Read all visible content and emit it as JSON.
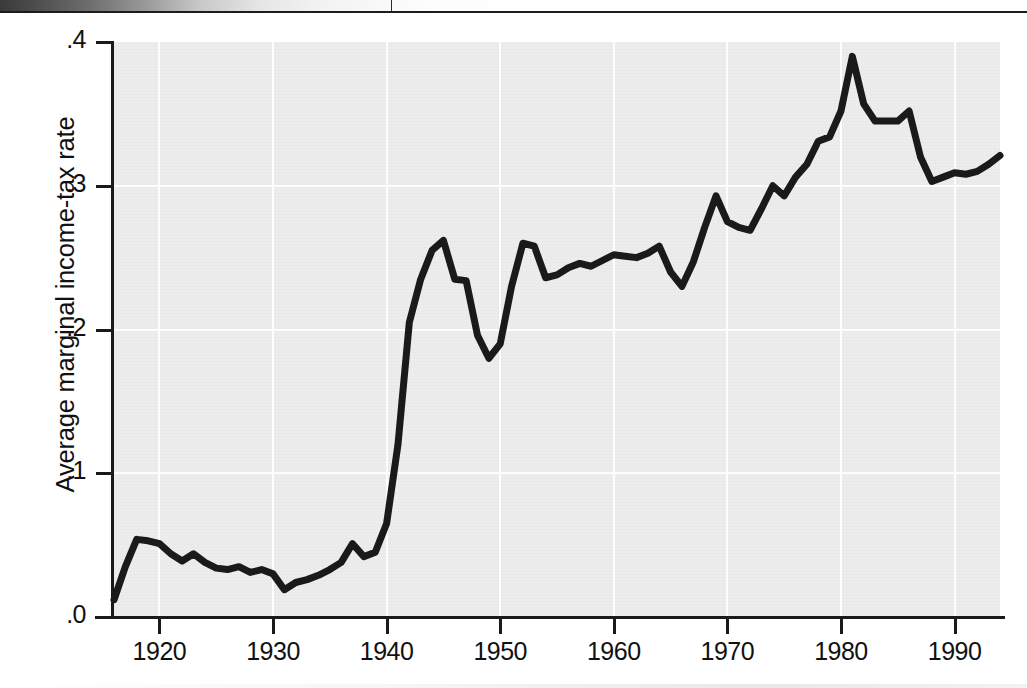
{
  "page": {
    "scan_header": {
      "tick_label": ""
    },
    "ghost_text": {
      "p1": "the rate of growth of real gross domestic product in the decades that followed. The estimates that follow rely on the constructed series and are reported in full in the appendix table.",
      "p2": "In addition, the average marginal rate rises sharply during the war years, then settles into a narrow band through the postwar expansion. The pattern is broadly consistent with the legislated changes in bracket structure and exemption levels over the period.",
      "h1": "5. The Empirical Results",
      "p3": "The results are summarized in table 3 and in figure 1 above.",
      "p4": "In all of the specifications the coefficient on the tax-rate variable is negative and, in most cases, statistically significant at conventional levels. The magnitude of the estimated effect is modest."
    }
  },
  "chart_data": {
    "type": "line",
    "title": "",
    "xlabel": "",
    "ylabel": "Average marginal income-tax rate",
    "xlim": [
      1916,
      1994
    ],
    "ylim": [
      0.0,
      0.4
    ],
    "grid": true,
    "legend": null,
    "xticks": [
      1920,
      1930,
      1940,
      1950,
      1960,
      1970,
      1980,
      1990
    ],
    "xtick_labels": [
      "1920",
      "1930",
      "1940",
      "1950",
      "1960",
      "1970",
      "1980",
      "1990"
    ],
    "yticks": [
      0.0,
      0.1,
      0.2,
      0.3,
      0.4
    ],
    "ytick_labels": [
      ".0",
      ".1",
      ".2",
      ".3",
      ".4"
    ],
    "colors": {
      "line": "#1a1a1a",
      "panel": "#ededed",
      "grid": "#ffffff",
      "axis": "#1a1a1a"
    },
    "series": [
      {
        "name": "Average marginal income-tax rate",
        "x": [
          1916,
          1917,
          1918,
          1919,
          1920,
          1921,
          1922,
          1923,
          1924,
          1925,
          1926,
          1927,
          1928,
          1929,
          1930,
          1931,
          1932,
          1933,
          1934,
          1935,
          1936,
          1937,
          1938,
          1939,
          1940,
          1941,
          1942,
          1943,
          1944,
          1945,
          1946,
          1947,
          1948,
          1949,
          1950,
          1951,
          1952,
          1953,
          1954,
          1955,
          1956,
          1957,
          1958,
          1959,
          1960,
          1961,
          1962,
          1963,
          1964,
          1965,
          1966,
          1967,
          1968,
          1969,
          1970,
          1971,
          1972,
          1973,
          1974,
          1975,
          1976,
          1977,
          1978,
          1979,
          1980,
          1981,
          1982,
          1983,
          1984,
          1985,
          1986,
          1987,
          1988,
          1989,
          1990,
          1991,
          1992,
          1993,
          1994
        ],
        "y": [
          0.012,
          0.035,
          0.054,
          0.053,
          0.051,
          0.044,
          0.039,
          0.044,
          0.038,
          0.034,
          0.033,
          0.035,
          0.031,
          0.033,
          0.03,
          0.019,
          0.024,
          0.026,
          0.029,
          0.033,
          0.038,
          0.051,
          0.042,
          0.045,
          0.065,
          0.12,
          0.205,
          0.235,
          0.255,
          0.262,
          0.235,
          0.234,
          0.196,
          0.18,
          0.19,
          0.23,
          0.26,
          0.258,
          0.236,
          0.238,
          0.243,
          0.246,
          0.244,
          0.248,
          0.252,
          0.251,
          0.25,
          0.253,
          0.258,
          0.24,
          0.23,
          0.247,
          0.271,
          0.293,
          0.275,
          0.271,
          0.269,
          0.284,
          0.3,
          0.293,
          0.306,
          0.315,
          0.331,
          0.334,
          0.352,
          0.39,
          0.357,
          0.345,
          0.345,
          0.345,
          0.352,
          0.32,
          0.303,
          0.306,
          0.309,
          0.308,
          0.31,
          0.315,
          0.321
        ]
      }
    ]
  }
}
